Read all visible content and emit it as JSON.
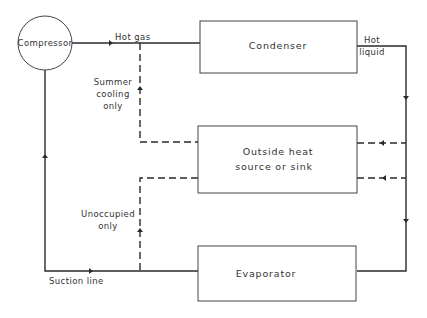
{
  "diagram": {
    "components": {
      "compressor": "Compressor",
      "condenser": "Condenser",
      "outside_line1": "Outside heat",
      "outside_line2": "source or sink",
      "evaporator": "Evaporator"
    },
    "labels": {
      "hot_gas": "Hot gas",
      "hot_liquid_1": "Hot",
      "hot_liquid_2": "liquid",
      "summer_1": "Summer",
      "summer_2": "cooling",
      "summer_3": "only",
      "unoccupied_1": "Unoccupied",
      "unoccupied_2": "only",
      "suction_line": "Suction line"
    },
    "colors": {
      "line": "#2a2a2a",
      "text": "#333333",
      "background": "#ffffff"
    }
  }
}
